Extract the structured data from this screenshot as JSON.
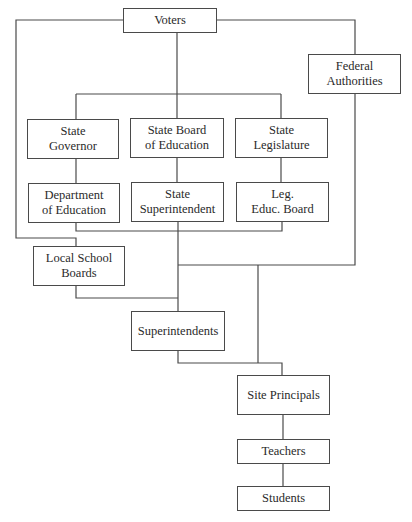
{
  "diagram": {
    "type": "organizational-hierarchy",
    "nodes": {
      "voters": {
        "label": "Voters"
      },
      "federal": {
        "label": "Federal\nAuthorities"
      },
      "governor": {
        "label": "State\nGovernor"
      },
      "state_board": {
        "label": "State Board\nof Education"
      },
      "legislature": {
        "label": "State\nLegislature"
      },
      "dept_ed": {
        "label": "Department\nof Education"
      },
      "state_supt": {
        "label": "State\nSuperintendent"
      },
      "leg_board": {
        "label": "Leg.\nEduc. Board"
      },
      "local_boards": {
        "label": "Local School\nBoards"
      },
      "superintendents": {
        "label": "Superintendents"
      },
      "principals": {
        "label": "Site Principals"
      },
      "teachers": {
        "label": "Teachers"
      },
      "students": {
        "label": "Students"
      }
    },
    "edges": [
      {
        "from": "Voters",
        "to": "Federal Authorities"
      },
      {
        "from": "Voters",
        "to": "State Governor"
      },
      {
        "from": "Voters",
        "to": "State Board of Education"
      },
      {
        "from": "Voters",
        "to": "State Legislature"
      },
      {
        "from": "Voters",
        "to": "Local School Boards"
      },
      {
        "from": "State Governor",
        "to": "Department of Education"
      },
      {
        "from": "State Board of Education",
        "to": "State Superintendent"
      },
      {
        "from": "State Legislature",
        "to": "Leg. Educ. Board"
      },
      {
        "from": "State tier",
        "to": "Superintendents"
      },
      {
        "from": "Local School Boards",
        "to": "Superintendents"
      },
      {
        "from": "Federal Authorities",
        "to": "Superintendents"
      },
      {
        "from": "Federal Authorities",
        "to": "Site Principals"
      },
      {
        "from": "Superintendents",
        "to": "Site Principals"
      },
      {
        "from": "Site Principals",
        "to": "Teachers"
      },
      {
        "from": "Teachers",
        "to": "Students"
      }
    ],
    "colors": {
      "line": "#4a4a4a",
      "background": "#ffffff",
      "text": "#2a2a2a"
    }
  }
}
